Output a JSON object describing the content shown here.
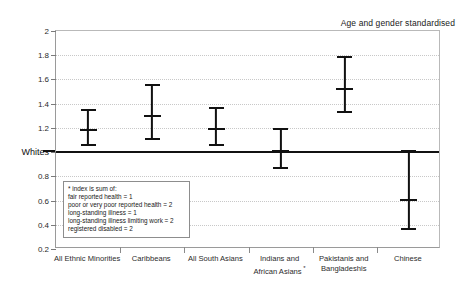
{
  "chart_data": {
    "type": "scatter",
    "title": "Age and gender standardised",
    "xlabel": "",
    "ylabel": "",
    "ylim": [
      0.2,
      2.0
    ],
    "yticks": [
      0.2,
      0.4,
      0.6,
      0.8,
      1.0,
      1.2,
      1.4,
      1.6,
      1.8,
      2.0
    ],
    "ytick_labels": [
      "0.2",
      "0.4",
      "0.6",
      "0.8",
      "Whites",
      "1.2",
      "1.4",
      "1.6",
      "1.8",
      "2"
    ],
    "grid": true,
    "legend_position": "none",
    "reference_line": {
      "label": "Whites",
      "value": 1.0
    },
    "categories": [
      "All Ethnic Minorities",
      "Caribbeans",
      "All South Asians",
      "Indians and\nAfrican Asians",
      "Pakistanis and\nBangladeshis",
      "Chinese"
    ],
    "values": [
      1.19,
      1.31,
      1.2,
      1.02,
      1.53,
      0.61
    ],
    "lower": [
      1.05,
      1.1,
      1.05,
      0.86,
      1.32,
      0.36
    ],
    "upper": [
      1.36,
      1.56,
      1.37,
      1.2,
      1.79,
      1.02
    ],
    "series": [
      {
        "name": "Relative risk of poor health index",
        "values": [
          1.19,
          1.31,
          1.2,
          1.02,
          1.53,
          0.61
        ]
      }
    ]
  },
  "title": {
    "text": "Age and gender standardised"
  },
  "yaxis": {
    "ticks": [
      {
        "value": 2.0,
        "label": "2"
      },
      {
        "value": 1.8,
        "label": "1.8"
      },
      {
        "value": 1.6,
        "label": "1.6"
      },
      {
        "value": 1.4,
        "label": "1.4"
      },
      {
        "value": 1.2,
        "label": "1.2"
      },
      {
        "value": 1.0,
        "label": "Whites"
      },
      {
        "value": 0.8,
        "label": "0.8"
      },
      {
        "value": 0.6,
        "label": "0.6"
      },
      {
        "value": 0.4,
        "label": "0.4"
      },
      {
        "value": 0.2,
        "label": "0.2"
      }
    ]
  },
  "xaxis": {
    "categories": [
      {
        "line1": "All Ethnic Minorities",
        "line2": "",
        "footnote": ""
      },
      {
        "line1": "Caribbeans",
        "line2": "",
        "footnote": ""
      },
      {
        "line1": "All South Asians",
        "line2": "",
        "footnote": ""
      },
      {
        "line1": "Indians and",
        "line2": "African Asians",
        "footnote": "*"
      },
      {
        "line1": "Pakistanis and",
        "line2": "Bangladeshis",
        "footnote": ""
      },
      {
        "line1": "Chinese",
        "line2": "",
        "footnote": ""
      }
    ]
  },
  "note_box": {
    "lines": [
      "* index is sum of:",
      "fair reported health = 1",
      "poor or very poor reported health = 2",
      "long-standing illness = 1",
      "long-standing illness limiting work = 2",
      "registered disabled = 2"
    ]
  },
  "colors": {
    "marker": "#111111",
    "reference_line": "#111111",
    "grid": "#c8c8c8",
    "axis": "#9a9a9a",
    "background": "#ffffff"
  }
}
